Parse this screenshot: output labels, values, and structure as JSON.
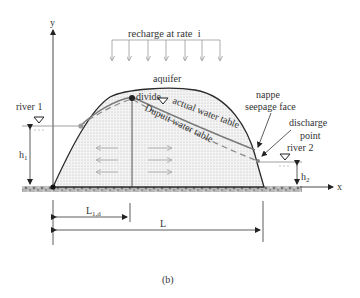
{
  "figure": {
    "caption": "(b)",
    "axes": {
      "y_label": "y",
      "x_label": "x"
    },
    "labels": {
      "recharge": "recharge at rate  i",
      "aquifer": "aquifer",
      "divide": "divide",
      "actual_water_table": "actual water table",
      "dupuit_water_table": "Dupuit water table",
      "nappe": "nappe",
      "seepage_face": "seepage face",
      "discharge": "discharge",
      "point": "point",
      "river1": "river 1",
      "river2": "river 2",
      "h1": "h",
      "h1_sub": "1",
      "h2": "h",
      "h2_sub": "2",
      "L1d": "L",
      "L1d_sub": "1,d",
      "L": "L"
    },
    "colors": {
      "outline": "#2a2a2a",
      "actual_table": "#808080",
      "dupuit_table": "#8a8a8a",
      "fill_dots": "#bdbdbd",
      "ground": "#9a9a9a",
      "flow_arrows": "#b0b0b0"
    }
  }
}
